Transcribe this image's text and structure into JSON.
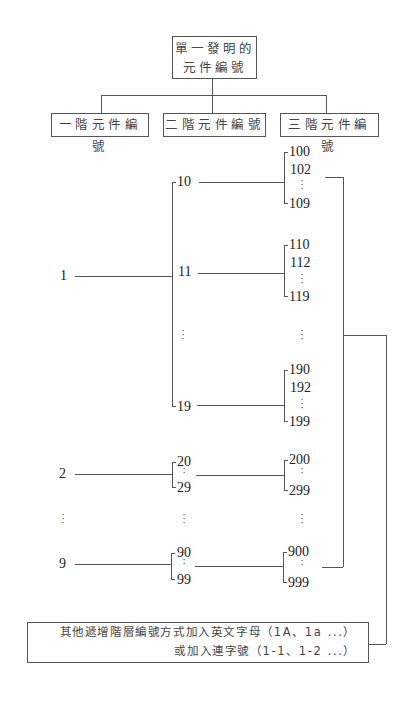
{
  "root": {
    "line1": "單一發明的",
    "line2": "元件編號"
  },
  "levels": [
    {
      "label": "一階元件編號"
    },
    {
      "label": "二階元件編號"
    },
    {
      "label": "三階元件編號"
    }
  ],
  "level1": {
    "items": [
      "1",
      "2",
      "9"
    ],
    "ellipsis": "⋮"
  },
  "level2": {
    "group1": [
      "10",
      "11",
      "19"
    ],
    "group2": [
      "20",
      "29"
    ],
    "group9": [
      "90",
      "99"
    ]
  },
  "level3": {
    "group10": [
      "100",
      "102",
      "109"
    ],
    "group11": [
      "110",
      "112",
      "119"
    ],
    "group19": [
      "190",
      "192",
      "199"
    ],
    "group2": [
      "200",
      "299"
    ],
    "group9": [
      "900",
      "999"
    ]
  },
  "note": {
    "line1": "其他遞增階層編號方式加入英文字母（1A、1a ...）",
    "line2": "或加入連字號（1-1、1-2 ...）"
  },
  "colors": {
    "line": "#555555",
    "text": "#2a2a2a",
    "background": "#ffffff"
  }
}
